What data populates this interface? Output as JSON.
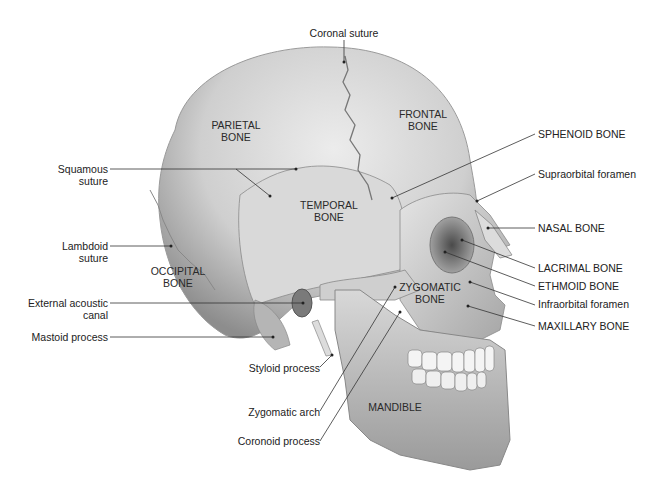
{
  "bone_labels": {
    "parietal": [
      "PARIETAL",
      "BONE"
    ],
    "frontal": [
      "FRONTAL",
      "BONE"
    ],
    "temporal": [
      "TEMPORAL",
      "BONE"
    ],
    "occipital": [
      "OCCIPITAL",
      "BONE"
    ],
    "zygomatic": [
      "ZYGOMATIC",
      "BONE"
    ],
    "mandible": [
      "MANDIBLE"
    ]
  },
  "callouts_left": [
    {
      "id": "squamous",
      "lines": [
        "Squamous",
        "suture"
      ]
    },
    {
      "id": "lambdoid",
      "lines": [
        "Lambdoid",
        "suture"
      ]
    },
    {
      "id": "ext-acoustic",
      "lines": [
        "External acoustic",
        "canal"
      ]
    },
    {
      "id": "mastoid",
      "lines": [
        "Mastoid process"
      ]
    },
    {
      "id": "styloid",
      "lines": [
        "Styloid process"
      ]
    },
    {
      "id": "zyg-arch",
      "lines": [
        "Zygomatic arch"
      ]
    },
    {
      "id": "coronoid",
      "lines": [
        "Coronoid process"
      ]
    }
  ],
  "callouts_top": [
    {
      "id": "coronal",
      "lines": [
        "Coronal suture"
      ]
    }
  ],
  "callouts_right": [
    {
      "id": "sphenoid",
      "lines": [
        "SPHENOID BONE"
      ]
    },
    {
      "id": "supraorbital",
      "lines": [
        "Supraorbital foramen"
      ]
    },
    {
      "id": "nasal",
      "lines": [
        "NASAL BONE"
      ]
    },
    {
      "id": "lacrimal",
      "lines": [
        "LACRIMAL BONE"
      ]
    },
    {
      "id": "ethmoid",
      "lines": [
        "ETHMOID BONE"
      ]
    },
    {
      "id": "infraorbital",
      "lines": [
        "Infraorbital foramen"
      ]
    },
    {
      "id": "maxillary",
      "lines": [
        "MAXILLARY BONE"
      ]
    }
  ],
  "colors": {
    "background": "#ffffff",
    "bone_light": "#e8e8e8",
    "bone_mid": "#bdbdbd",
    "bone_dark": "#7a7a7a",
    "leader_line": "#333333",
    "text": "#222222"
  }
}
